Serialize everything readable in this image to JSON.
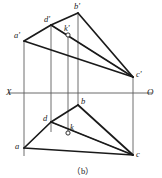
{
  "figure": {
    "caption": "（b）",
    "caption_pos": {
      "x": 72,
      "y": 164
    },
    "width": 162,
    "height": 178,
    "background": "#ffffff",
    "stroke_color": "#1a1a1a",
    "thin_stroke_color": "#4a4a4a",
    "axis_color": "#5a5a5a"
  },
  "axis": {
    "name": "projection-axis",
    "x_label": "X",
    "o_label": "O",
    "y": 93,
    "x_start": 8,
    "x_end": 152,
    "x_label_pos": {
      "x": 6,
      "y": 88
    },
    "o_label_pos": {
      "x": 147,
      "y": 88
    }
  },
  "points": [
    {
      "id": "a_prime",
      "label": "a'",
      "x": 24,
      "y": 41,
      "lx": 14,
      "ly": 31,
      "marker": false
    },
    {
      "id": "d_prime",
      "label": "d'",
      "x": 51,
      "y": 25,
      "lx": 44,
      "ly": 15,
      "marker": false
    },
    {
      "id": "b_prime",
      "label": "b'",
      "x": 78,
      "y": 13,
      "lx": 74,
      "ly": 2,
      "marker": false
    },
    {
      "id": "k_prime",
      "label": "k'",
      "x": 68,
      "y": 35,
      "lx": 64,
      "ly": 24,
      "marker": true
    },
    {
      "id": "c_prime",
      "label": "c'",
      "x": 133,
      "y": 77,
      "lx": 136,
      "ly": 70,
      "marker": false
    },
    {
      "id": "b",
      "label": "b",
      "x": 78,
      "y": 105,
      "lx": 81,
      "ly": 97,
      "marker": false
    },
    {
      "id": "d",
      "label": "d",
      "x": 51,
      "y": 122,
      "lx": 43,
      "ly": 114,
      "marker": false
    },
    {
      "id": "k",
      "label": "k",
      "x": 68,
      "y": 133,
      "lx": 70,
      "ly": 123,
      "marker": true
    },
    {
      "id": "a",
      "label": "a",
      "x": 24,
      "y": 148,
      "lx": 15,
      "ly": 142,
      "marker": false
    },
    {
      "id": "c",
      "label": "c",
      "x": 133,
      "y": 155,
      "lx": 136,
      "ly": 150,
      "marker": false
    }
  ],
  "thick_edges": [
    {
      "name": "edge-ap-dp",
      "x1": 24,
      "y1": 41,
      "x2": 51,
      "y2": 25
    },
    {
      "name": "edge-dp-bp",
      "x1": 51,
      "y1": 25,
      "x2": 78,
      "y2": 13
    },
    {
      "name": "edge-bp-cp",
      "x1": 78,
      "y1": 13,
      "x2": 133,
      "y2": 77
    },
    {
      "name": "edge-ap-cp",
      "x1": 24,
      "y1": 41,
      "x2": 133,
      "y2": 77
    },
    {
      "name": "edge-dp-cp",
      "x1": 51,
      "y1": 25,
      "x2": 133,
      "y2": 77
    },
    {
      "name": "edge-a-d",
      "x1": 24,
      "y1": 148,
      "x2": 51,
      "y2": 122
    },
    {
      "name": "edge-d-b",
      "x1": 51,
      "y1": 122,
      "x2": 78,
      "y2": 105
    },
    {
      "name": "edge-b-c",
      "x1": 78,
      "y1": 105,
      "x2": 133,
      "y2": 155
    },
    {
      "name": "edge-a-c",
      "x1": 24,
      "y1": 148,
      "x2": 133,
      "y2": 155
    },
    {
      "name": "edge-d-c",
      "x1": 51,
      "y1": 122,
      "x2": 133,
      "y2": 155
    }
  ],
  "thin_edges": [
    {
      "name": "ray-ap-kp-cp",
      "x1": 51,
      "y1": 25,
      "x2": 133,
      "y2": 77
    },
    {
      "name": "ray-d-k-c",
      "x1": 51,
      "y1": 122,
      "x2": 133,
      "y2": 155
    }
  ],
  "projection_lines": [
    {
      "name": "projector-a",
      "x": 24,
      "y1": 41,
      "y2": 156
    },
    {
      "name": "projector-d",
      "x": 51,
      "y1": 25,
      "y2": 132
    },
    {
      "name": "projector-k",
      "x": 68,
      "y1": 35,
      "y2": 133
    },
    {
      "name": "projector-b",
      "x": 78,
      "y1": 13,
      "y2": 105
    },
    {
      "name": "projector-c",
      "x": 133,
      "y1": 77,
      "y2": 155
    }
  ],
  "markers": {
    "radius": 2.1,
    "fill": "#ffffff",
    "stroke": "#1a1a1a"
  }
}
